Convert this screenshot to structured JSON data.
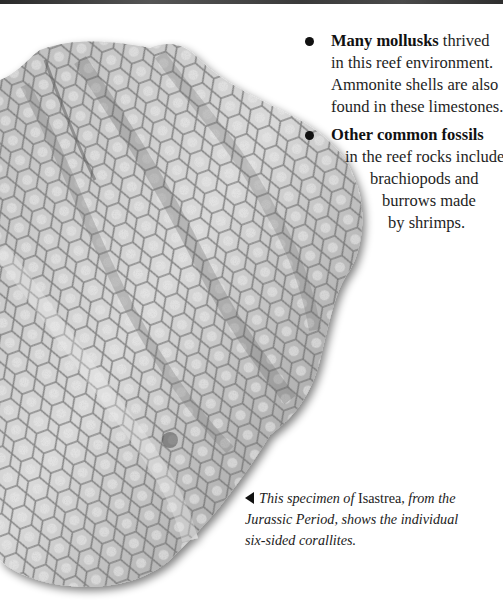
{
  "page": {
    "top_strip": "dark photo edge",
    "image": {
      "subject": "Isastrea coral fossil specimen",
      "style": "grayscale photograph with honeycomb six-sided corallites"
    },
    "bullets": [
      {
        "bold": "Many mollusks",
        "lines": [
          " thrived",
          "in this reef environment.",
          "Ammonite shells are also",
          "found in these limestones."
        ]
      },
      {
        "bold": "Other common fossils",
        "lines": [
          "in the reef rocks include",
          "brachiopods and",
          "burrows made",
          "by shrimps."
        ]
      }
    ],
    "caption": {
      "pointer": "◀",
      "part1": "This specimen of ",
      "genus": "Isastrea",
      "part2": ", from the",
      "line2": "Jurassic Period, shows the individual",
      "line3": "six-sided corallites."
    }
  }
}
